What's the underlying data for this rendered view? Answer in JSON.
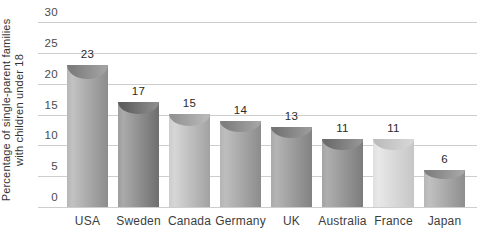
{
  "chart_data": {
    "type": "bar",
    "title": "",
    "ylabel_lines": [
      "Percentage of single-parent families",
      "with children under 18"
    ],
    "categories": [
      "USA",
      "Sweden",
      "Canada",
      "Germany",
      "UK",
      "Australia",
      "France",
      "Japan"
    ],
    "values": [
      23,
      17,
      15,
      14,
      13,
      11,
      11,
      6
    ],
    "value_labels": [
      "23",
      "17",
      "15",
      "14",
      "13",
      "11",
      "11",
      "6"
    ],
    "ylim": [
      0,
      30
    ],
    "yticks": [
      "0",
      "5",
      "10",
      "15",
      "20",
      "25",
      "30"
    ],
    "grid": "horizontal",
    "legend": "none",
    "colors": {
      "background": "#ffffff",
      "gridline": "#cdcdcd",
      "tick_label": "#4a4a4a",
      "value_label": "#2a2a2a",
      "category_label": "#3d3d3d",
      "axis_title": "#333333"
    },
    "bar_styles": [
      {
        "name": "usa-bar",
        "light": "#c2c2c2",
        "base": "#b6b6b6",
        "dark": "#8c8c8c",
        "crescent_dark": "#7d7d7d",
        "crescent_light": "#a2a2a2"
      },
      {
        "name": "sweden-bar",
        "light": "#aaaaaa",
        "base": "#9e9e9e",
        "dark": "#6e6e6e",
        "crescent_dark": "#5e5e5e",
        "crescent_light": "#8c8c8c"
      },
      {
        "name": "canada-bar",
        "light": "#d6d6d6",
        "base": "#cccccc",
        "dark": "#a2a2a2",
        "crescent_dark": "#949494",
        "crescent_light": "#b8b8b8"
      },
      {
        "name": "germany-bar",
        "light": "#bebebe",
        "base": "#b4b4b4",
        "dark": "#8c8c8c",
        "crescent_dark": "#7e7e7e",
        "crescent_light": "#a4a4a4"
      },
      {
        "name": "uk-bar",
        "light": "#b4b4b4",
        "base": "#aaaaaa",
        "dark": "#828282",
        "crescent_dark": "#747474",
        "crescent_light": "#9a9a9a"
      },
      {
        "name": "australia-bar",
        "light": "#aeaeae",
        "base": "#a4a4a4",
        "dark": "#7c7c7c",
        "crescent_dark": "#6c6c6c",
        "crescent_light": "#949494"
      },
      {
        "name": "france-bar",
        "light": "#e8e8e8",
        "base": "#e0e0e0",
        "dark": "#c6c6c6",
        "crescent_dark": "#bdbdbd",
        "crescent_light": "#d6d6d6"
      },
      {
        "name": "japan-bar",
        "light": "#c0c0c0",
        "base": "#b6b6b6",
        "dark": "#8e8e8e",
        "crescent_dark": "#808080",
        "crescent_light": "#a6a6a6"
      }
    ]
  }
}
